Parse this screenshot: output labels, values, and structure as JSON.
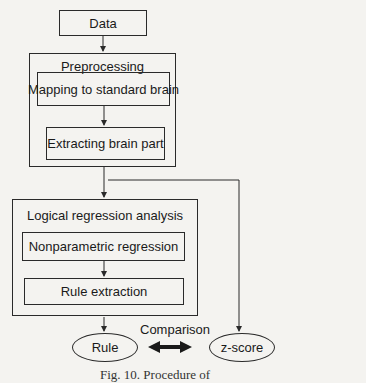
{
  "diagram": {
    "nodes": {
      "data": {
        "label": "Data"
      },
      "preprocessing": {
        "label": "Preprocessing",
        "steps": [
          {
            "label": "Mapping to standard brain"
          },
          {
            "label": "Extracting brain part"
          }
        ]
      },
      "logical_regression": {
        "label": "Logical regression analysis",
        "steps": [
          {
            "label": "Nonparametric regression"
          },
          {
            "label": "Rule extraction"
          }
        ]
      },
      "rule": {
        "label": "Rule"
      },
      "zscore": {
        "label": "z-score"
      }
    },
    "edges": [
      {
        "from": "Data",
        "to": "Preprocessing"
      },
      {
        "from": "Mapping to standard brain",
        "to": "Extracting brain part"
      },
      {
        "from": "Preprocessing",
        "to": "Logical regression analysis"
      },
      {
        "from": "Preprocessing",
        "to": "z-score"
      },
      {
        "from": "Nonparametric regression",
        "to": "Rule extraction"
      },
      {
        "from": "Logical regression analysis",
        "to": "Rule"
      },
      {
        "from": "Rule",
        "to": "z-score",
        "label": "Comparison",
        "bidirectional": true
      }
    ],
    "comparison_label": "Comparison",
    "caption": "Fig. 10. Procedure of"
  },
  "colors": {
    "line": "#2a2a2a",
    "background": "#f4f3f0"
  }
}
